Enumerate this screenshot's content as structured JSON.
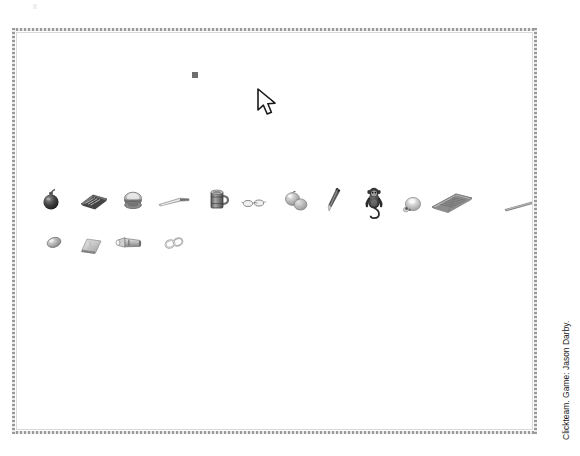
{
  "window": {
    "background_color": "#ffffff",
    "frame_color": "#9a9a9a",
    "inner_border_color": "#d9d9d9"
  },
  "credit": {
    "text": "Clickteam. Game: Jason Darby.",
    "rotation": "-90deg",
    "color": "#171717"
  },
  "cursor": {
    "name": "mouse-pointer",
    "x": 256,
    "y": 88,
    "fill": "#ffffff",
    "stroke": "#1a1a1a"
  },
  "selection_marker": {
    "name": "selection-square",
    "x": 195,
    "y": 75,
    "size": 6,
    "color": "#6e6e6e"
  },
  "inventory": {
    "row_one_label": "Inventory row 1",
    "row_two_label": "Inventory row 2",
    "row_one_y": 202,
    "row_two_y": 245,
    "items": [
      {
        "id": "bomb",
        "label": "Bomb",
        "icon": "bomb-icon",
        "x": 51,
        "y": 200,
        "row": 1,
        "color": "#3a3a3a"
      },
      {
        "id": "book",
        "label": "Book",
        "icon": "book-icon",
        "x": 94,
        "y": 201,
        "row": 1,
        "color": "#6b6b6b"
      },
      {
        "id": "hat",
        "label": "Hat",
        "icon": "hat-icon",
        "x": 133,
        "y": 201,
        "row": 1,
        "color": "#8a8a8a"
      },
      {
        "id": "knife",
        "label": "Knife",
        "icon": "knife-icon",
        "x": 175,
        "y": 202,
        "row": 1,
        "color": "#9b9b9b"
      },
      {
        "id": "mug",
        "label": "Mug",
        "icon": "mug-icon",
        "x": 219,
        "y": 200,
        "row": 1,
        "color": "#7a7a7a"
      },
      {
        "id": "glasses",
        "label": "Glasses",
        "icon": "glasses-icon",
        "x": 254,
        "y": 203,
        "row": 1,
        "color": "#b4b4b4"
      },
      {
        "id": "fruit",
        "label": "Fruit",
        "icon": "fruit-icon",
        "x": 296,
        "y": 201,
        "row": 1,
        "color": "#989898"
      },
      {
        "id": "pen",
        "label": "Pen",
        "icon": "pen-icon",
        "x": 334,
        "y": 201,
        "row": 1,
        "color": "#5e5e5e"
      },
      {
        "id": "monkey",
        "label": "Monkey",
        "icon": "monkey-icon",
        "x": 374,
        "y": 203,
        "row": 1,
        "color": "#2e2e2e"
      },
      {
        "id": "skull",
        "label": "Skull",
        "icon": "skull-icon",
        "x": 412,
        "y": 205,
        "row": 1,
        "color": "#a0a0a0"
      },
      {
        "id": "newspaper",
        "label": "Newspaper",
        "icon": "newspaper-icon",
        "x": 452,
        "y": 203,
        "row": 1,
        "color": "#9d9d9d"
      },
      {
        "id": "stick",
        "label": "Stick",
        "icon": "stick-icon",
        "x": 519,
        "y": 206,
        "row": 1,
        "color": "#868686"
      },
      {
        "id": "stone",
        "label": "Stone",
        "icon": "stone-icon",
        "x": 54,
        "y": 242,
        "row": 2,
        "color": "#8d8d8d"
      },
      {
        "id": "cloth",
        "label": "Cloth",
        "icon": "cloth-icon",
        "x": 92,
        "y": 245,
        "row": 2,
        "color": "#b0b0b0"
      },
      {
        "id": "flashlight",
        "label": "Flashlight",
        "icon": "flashlight-icon",
        "x": 129,
        "y": 243,
        "row": 2,
        "color": "#8f8f8f"
      },
      {
        "id": "rings",
        "label": "Rings",
        "icon": "rings-icon",
        "x": 174,
        "y": 243,
        "row": 2,
        "color": "#ababab"
      }
    ]
  }
}
